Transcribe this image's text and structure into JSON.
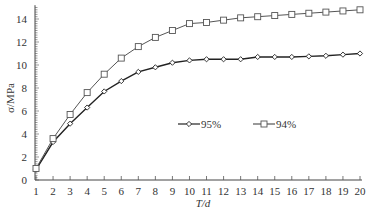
{
  "chart_data": {
    "type": "line",
    "title": "",
    "xlabel": "T/d",
    "ylabel": "σ/MPa",
    "x": [
      1,
      2,
      3,
      4,
      5,
      6,
      7,
      8,
      9,
      10,
      11,
      12,
      13,
      14,
      15,
      16,
      17,
      18,
      19,
      20
    ],
    "xlim": [
      1,
      20
    ],
    "ylim": [
      0,
      15
    ],
    "yticks": [
      0,
      2,
      4,
      6,
      8,
      10,
      12,
      14
    ],
    "xticks": [
      1,
      2,
      3,
      4,
      5,
      6,
      7,
      8,
      9,
      10,
      11,
      12,
      13,
      14,
      15,
      16,
      17,
      18,
      19,
      20
    ],
    "grid": false,
    "legend_position": "center-inside",
    "series": [
      {
        "name": "95%",
        "marker": "diamond",
        "color": "#222222",
        "values": [
          0.9,
          3.3,
          4.9,
          6.3,
          7.7,
          8.6,
          9.4,
          9.8,
          10.2,
          10.4,
          10.5,
          10.5,
          10.5,
          10.7,
          10.7,
          10.7,
          10.75,
          10.8,
          10.9,
          11.0
        ]
      },
      {
        "name": "94%",
        "marker": "square",
        "color": "#555555",
        "values": [
          1.0,
          3.6,
          5.7,
          7.6,
          9.2,
          10.6,
          11.6,
          12.4,
          13.0,
          13.6,
          13.7,
          13.9,
          14.1,
          14.2,
          14.3,
          14.4,
          14.5,
          14.6,
          14.7,
          14.8
        ]
      }
    ]
  }
}
